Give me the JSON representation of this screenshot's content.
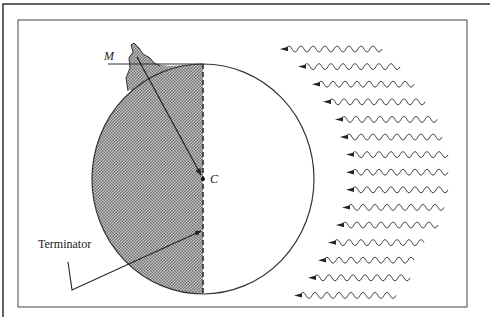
{
  "diagram": {
    "labels": {
      "mountain": "M",
      "center": "C",
      "terminator": "Terminator"
    },
    "wave_count": 15,
    "colors": {
      "ink": "#333333",
      "shade": "#9a9a9a",
      "background": "#ffffff"
    }
  }
}
